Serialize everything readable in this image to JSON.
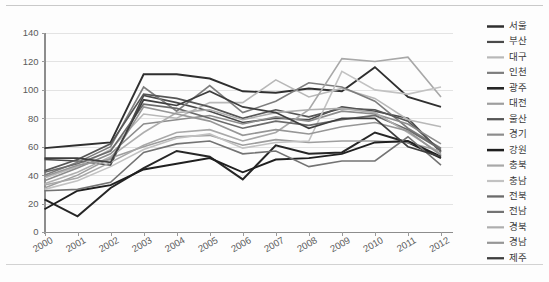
{
  "chart_data": {
    "type": "line",
    "title": "",
    "subtitle": "",
    "xlabel": "",
    "ylabel": "",
    "categories": [
      "2000",
      "2001",
      "2002",
      "2003",
      "2004",
      "2005",
      "2006",
      "2007",
      "2008",
      "2009",
      "2010",
      "2011",
      "2012"
    ],
    "xlim": [
      "2000",
      "2012"
    ],
    "ylim": [
      0,
      140
    ],
    "yticks": [
      0,
      20,
      40,
      60,
      80,
      100,
      120,
      140
    ],
    "grid": true,
    "legend_position": "right",
    "series": [
      {
        "name": "서울",
        "color": "#2f2f2f",
        "width": 1.9,
        "values": [
          59,
          61,
          63,
          111,
          111,
          108,
          99,
          98,
          101,
          99,
          116,
          95,
          88
        ]
      },
      {
        "name": "부산",
        "color": "#4a4a4a",
        "width": 1.6,
        "values": [
          51,
          50,
          47,
          96,
          91,
          85,
          77,
          80,
          79,
          88,
          85,
          80,
          56
        ]
      },
      {
        "name": "대구",
        "color": "#b8b8b8",
        "width": 1.6,
        "values": [
          38,
          46,
          58,
          83,
          80,
          91,
          91,
          107,
          95,
          101,
          94,
          79,
          74
        ]
      },
      {
        "name": "인천",
        "color": "#7d7d7d",
        "width": 1.6,
        "values": [
          40,
          49,
          60,
          102,
          85,
          103,
          84,
          92,
          105,
          102,
          92,
          73,
          59
        ]
      },
      {
        "name": "광주",
        "color": "#262626",
        "width": 2.0,
        "values": [
          23,
          11,
          31,
          45,
          57,
          53,
          37,
          61,
          55,
          56,
          70,
          63,
          52
        ]
      },
      {
        "name": "대전",
        "color": "#9e9e9e",
        "width": 1.6,
        "values": [
          31,
          40,
          52,
          60,
          67,
          68,
          61,
          65,
          63,
          64,
          64,
          63,
          57
        ]
      },
      {
        "name": "울산",
        "color": "#565656",
        "width": 1.7,
        "values": [
          43,
          51,
          62,
          97,
          94,
          88,
          80,
          86,
          81,
          87,
          86,
          78,
          57
        ]
      },
      {
        "name": "경기",
        "color": "#8c8c8c",
        "width": 1.6,
        "values": [
          36,
          45,
          55,
          76,
          79,
          82,
          76,
          81,
          78,
          85,
          83,
          76,
          62
        ]
      },
      {
        "name": "강원",
        "color": "#1f1f1f",
        "width": 1.9,
        "values": [
          16,
          29,
          33,
          44,
          48,
          52,
          42,
          51,
          52,
          55,
          63,
          64,
          53
        ]
      },
      {
        "name": "충북",
        "color": "#a8a8a8",
        "width": 1.6,
        "values": [
          33,
          38,
          49,
          61,
          70,
          72,
          64,
          70,
          86,
          122,
          120,
          123,
          95
        ]
      },
      {
        "name": "충남",
        "color": "#c2c2c2",
        "width": 1.6,
        "values": [
          30,
          36,
          46,
          58,
          66,
          69,
          59,
          63,
          64,
          113,
          100,
          97,
          102
        ]
      },
      {
        "name": "전북",
        "color": "#6b6b6b",
        "width": 1.7,
        "values": [
          42,
          48,
          57,
          90,
          87,
          80,
          73,
          78,
          75,
          79,
          82,
          72,
          58
        ]
      },
      {
        "name": "전남",
        "color": "#737373",
        "width": 1.6,
        "values": [
          29,
          30,
          35,
          56,
          62,
          64,
          55,
          57,
          46,
          50,
          50,
          67,
          47
        ]
      },
      {
        "name": "경북",
        "color": "#aeaeae",
        "width": 1.6,
        "values": [
          34,
          42,
          53,
          70,
          84,
          86,
          79,
          84,
          86,
          87,
          84,
          70,
          55
        ]
      },
      {
        "name": "경남",
        "color": "#969696",
        "width": 1.6,
        "values": [
          39,
          47,
          51,
          88,
          83,
          78,
          68,
          72,
          69,
          74,
          77,
          71,
          54
        ]
      },
      {
        "name": "제주",
        "color": "#3e3e3e",
        "width": 1.7,
        "values": [
          52,
          52,
          49,
          93,
          89,
          99,
          88,
          84,
          73,
          80,
          80,
          60,
          53
        ]
      }
    ]
  },
  "axes": {
    "y_tick_labels": [
      "140",
      "120",
      "100",
      "80",
      "60",
      "40",
      "20",
      "0"
    ],
    "x_tick_labels": [
      "2000",
      "2001",
      "2002",
      "2003",
      "2004",
      "2005",
      "2006",
      "2007",
      "2008",
      "2009",
      "2010",
      "2011",
      "2012"
    ]
  },
  "legend": {
    "items": [
      {
        "label": "서울"
      },
      {
        "label": "부산"
      },
      {
        "label": "대구"
      },
      {
        "label": "인천"
      },
      {
        "label": "광주"
      },
      {
        "label": "대전"
      },
      {
        "label": "울산"
      },
      {
        "label": "경기"
      },
      {
        "label": "강원"
      },
      {
        "label": "충북"
      },
      {
        "label": "충남"
      },
      {
        "label": "전북"
      },
      {
        "label": "전남"
      },
      {
        "label": "경북"
      },
      {
        "label": "경남"
      },
      {
        "label": "제주"
      }
    ]
  },
  "colors": {
    "background": "#fdfdfd",
    "gridline": "#e3e3e3",
    "axis": "#8d8d8d",
    "tick_text": "#5b5b5b",
    "legend_text": "#3a3a3a"
  }
}
